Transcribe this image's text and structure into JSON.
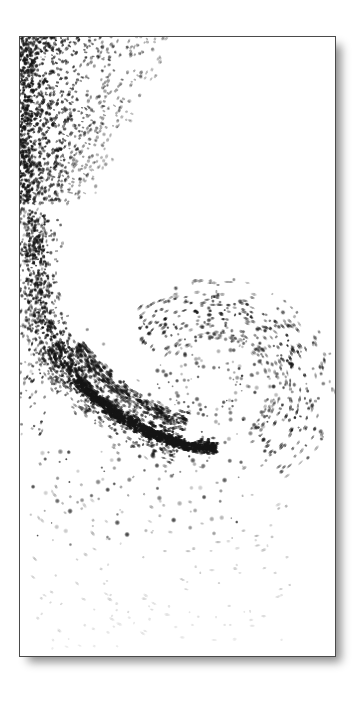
{
  "figure": {
    "title": "",
    "caption": "",
    "background_color": "#ffffff",
    "border_color": "#4a4a4a",
    "particle_color": "#141414",
    "shadow_color": "rgba(0,0,0,0.45)",
    "frame": {
      "x": 19,
      "y": 36,
      "width": 317,
      "height": 621
    }
  },
  "chart_data": {
    "type": "scatter",
    "title": "",
    "subtitle": "",
    "xlabel": "",
    "ylabel": "",
    "xlim": [
      0,
      317
    ],
    "ylim": [
      0,
      621
    ],
    "grid": false,
    "legend_position": "none",
    "annotations": [],
    "tick_labels": {
      "x": [],
      "y": []
    },
    "marker_style": "elongated dash (motion-blurred particle streaks)",
    "regions": [
      {
        "name": "upper-left-dense-plume",
        "density": "very-high",
        "opacity_range": [
          0.55,
          1.0
        ],
        "x_range": [
          0,
          150
        ],
        "y_range": [
          0,
          160
        ],
        "point_count": 1500
      },
      {
        "name": "left-neck-band",
        "density": "high",
        "opacity_range": [
          0.45,
          0.95
        ],
        "x_range": [
          0,
          70
        ],
        "y_range": [
          150,
          300
        ],
        "point_count": 620
      },
      {
        "name": "lower-left-sweep",
        "density": "high",
        "opacity_range": [
          0.4,
          1.0
        ],
        "x_range": [
          0,
          130
        ],
        "y_range": [
          290,
          430
        ],
        "point_count": 520
      },
      {
        "name": "dark-filament-streak",
        "density": "very-high",
        "opacity_range": [
          0.7,
          1.0
        ],
        "x_range": [
          10,
          215
        ],
        "y_range": [
          360,
          430
        ],
        "point_count": 700
      },
      {
        "name": "vortex-arc-right",
        "density": "medium",
        "opacity_range": [
          0.35,
          0.9
        ],
        "x_range": [
          140,
          300
        ],
        "y_range": [
          240,
          440
        ],
        "point_count": 430
      },
      {
        "name": "sparse-tail-bottom",
        "density": "low",
        "opacity_range": [
          0.12,
          0.45
        ],
        "x_range": [
          0,
          260
        ],
        "y_range": [
          430,
          621
        ],
        "point_count": 150
      }
    ],
    "series": [
      {
        "name": "particles",
        "marker": "streak",
        "color": "#141414",
        "count": 3920
      }
    ]
  }
}
